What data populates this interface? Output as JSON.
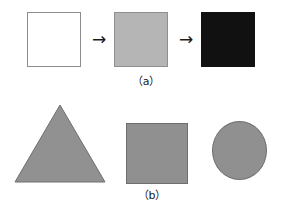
{
  "figure": {
    "background_color": "#ffffff",
    "rows": [
      {
        "caption": "（a）",
        "caption_name": "caption-a",
        "items": [
          {
            "name": "white-square",
            "shape": "square",
            "fill": "#ffffff",
            "stroke": "#8c8c8c",
            "label": "white square"
          },
          {
            "name": "arrow-1",
            "shape": "arrow-right",
            "glyph": "→",
            "label": "arrow right"
          },
          {
            "name": "gray-square-a",
            "shape": "square",
            "fill": "#b5b5b5",
            "stroke": "#8f8f8f",
            "label": "gray square"
          },
          {
            "name": "arrow-2",
            "shape": "arrow-right",
            "glyph": "→",
            "label": "arrow right"
          },
          {
            "name": "black-square",
            "shape": "square",
            "fill": "#111111",
            "stroke": "#111111",
            "label": "black square"
          }
        ]
      },
      {
        "caption": "（b）",
        "caption_name": "caption-b",
        "items": [
          {
            "name": "gray-triangle",
            "shape": "triangle",
            "fill": "#919191",
            "stroke": "#6e6e6e",
            "label": "gray triangle"
          },
          {
            "name": "gray-square-b",
            "shape": "square",
            "fill": "#909090",
            "stroke": "#6e6e6e",
            "label": "gray square"
          },
          {
            "name": "gray-circle",
            "shape": "circle",
            "fill": "#909090",
            "stroke": "#6e6e6e",
            "label": "gray circle"
          }
        ]
      }
    ]
  }
}
